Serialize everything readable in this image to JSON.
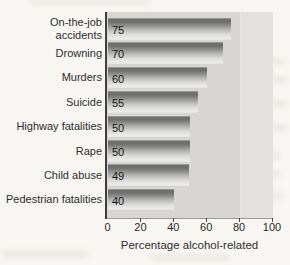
{
  "figure": {
    "page_bg": "#f7f6f2",
    "plot_bg": "#d7d6d2",
    "plot_bg_light_band": "#e2e1dd",
    "axis_color": "#3f3f3f",
    "text_color": "#2e2e2e"
  },
  "chart_data": {
    "type": "bar",
    "orientation": "horizontal",
    "title": "",
    "xlabel": "Percentage alcohol-related",
    "ylabel": "",
    "categories": [
      "On-the-job accidents",
      "Drowning",
      "Murders",
      "Suicide",
      "Highway fatalities",
      "Rape",
      "Child abuse",
      "Pedestrian fatalities"
    ],
    "label_lines": [
      [
        "On-the-job",
        "accidents"
      ],
      [
        "Drowning"
      ],
      [
        "Murders"
      ],
      [
        "Suicide"
      ],
      [
        "Highway fatalities"
      ],
      [
        "Rape"
      ],
      [
        "Child abuse"
      ],
      [
        "Pedestrian fatalities"
      ]
    ],
    "values": [
      75,
      70,
      60,
      55,
      50,
      50,
      49,
      40
    ],
    "value_labels": [
      "75",
      "70",
      "60",
      "55",
      "50",
      "50",
      "49",
      "40"
    ],
    "xlim": [
      0,
      100
    ],
    "xticks": [
      0,
      20,
      40,
      60,
      80,
      100
    ],
    "grid": false,
    "legend": null,
    "bar_style": "gray 3d tube gradient, value label inside bar at left"
  }
}
